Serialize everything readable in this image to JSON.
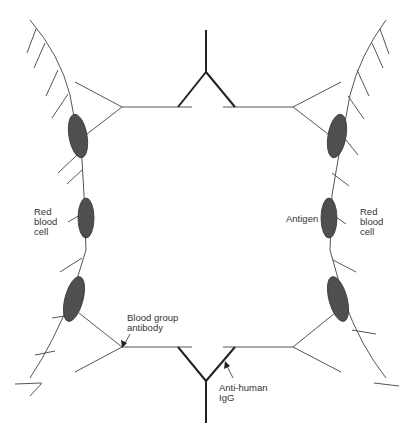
{
  "figure": {
    "colors": {
      "cell_fill": "#4f4f4f",
      "line": "#555555",
      "igg_line": "#222222",
      "text": "#333333"
    }
  },
  "labels": {
    "left_rbc": "Red\nblood\ncell",
    "right_rbc": "Red\nblood\ncell",
    "antigen": "Antigen",
    "blood_group_antibody": "Blood group\nantibody",
    "anti_human_igg": "Anti-human\nIgG"
  }
}
